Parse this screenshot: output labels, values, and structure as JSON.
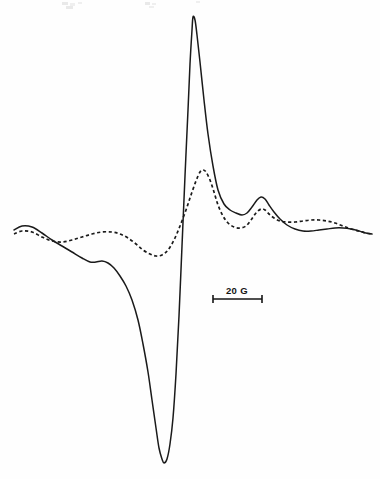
{
  "figure": {
    "title": "",
    "background_color": "#fefefe",
    "width": 380,
    "height": 479
  },
  "scalebar": {
    "label": "20 G",
    "value": 20,
    "unit": "G",
    "unit_name": "gauss",
    "x_start": 213,
    "x_end": 262,
    "y": 299,
    "tick_half_height": 4,
    "label_x": 237,
    "label_y": 294,
    "color": "#151515"
  },
  "chart_data": {
    "type": "line",
    "title": "",
    "subtitle": "",
    "xlabel": "",
    "ylabel": "",
    "grid": false,
    "legend_position": "none",
    "axes_visible": false,
    "x_units": "gauss (relative magnetic field)",
    "y_units": "first derivative of absorption (arbitrary units)",
    "xlim": [
      14,
      372
    ],
    "ylim": [
      479,
      12
    ],
    "series": [
      {
        "name": "solid-trace",
        "style": "solid",
        "color": "#1a1a1a",
        "stroke_width": 1.5,
        "peak_max": {
          "x": 193,
          "y": 17
        },
        "peak_min": {
          "x": 163,
          "y": 463
        },
        "points": [
          [
            14,
            230
          ],
          [
            22,
            226
          ],
          [
            32,
            227
          ],
          [
            42,
            233
          ],
          [
            52,
            240
          ],
          [
            62,
            246
          ],
          [
            72,
            252
          ],
          [
            82,
            258
          ],
          [
            90,
            262
          ],
          [
            96,
            262
          ],
          [
            102,
            261
          ],
          [
            108,
            263
          ],
          [
            114,
            268
          ],
          [
            120,
            276
          ],
          [
            126,
            286
          ],
          [
            132,
            300
          ],
          [
            138,
            320
          ],
          [
            143,
            344
          ],
          [
            148,
            372
          ],
          [
            152,
            400
          ],
          [
            156,
            428
          ],
          [
            159,
            448
          ],
          [
            162,
            459
          ],
          [
            164,
            463
          ],
          [
            167,
            459
          ],
          [
            170,
            444
          ],
          [
            173,
            418
          ],
          [
            176,
            374
          ],
          [
            179,
            316
          ],
          [
            182,
            246
          ],
          [
            185,
            176
          ],
          [
            188,
            110
          ],
          [
            190,
            64
          ],
          [
            192,
            30
          ],
          [
            193,
            17
          ],
          [
            195,
            20
          ],
          [
            197,
            35
          ],
          [
            200,
            62
          ],
          [
            204,
            100
          ],
          [
            208,
            134
          ],
          [
            213,
            166
          ],
          [
            218,
            190
          ],
          [
            224,
            204
          ],
          [
            230,
            210
          ],
          [
            236,
            213
          ],
          [
            242,
            215
          ],
          [
            247,
            213
          ],
          [
            252,
            207
          ],
          [
            257,
            200
          ],
          [
            261,
            197
          ],
          [
            265,
            199
          ],
          [
            269,
            205
          ],
          [
            274,
            212
          ],
          [
            280,
            219
          ],
          [
            287,
            225
          ],
          [
            295,
            229
          ],
          [
            303,
            231
          ],
          [
            311,
            231
          ],
          [
            319,
            230
          ],
          [
            327,
            229
          ],
          [
            335,
            228
          ],
          [
            343,
            228
          ],
          [
            351,
            229
          ],
          [
            359,
            231
          ],
          [
            366,
            233
          ],
          [
            372,
            234
          ]
        ]
      },
      {
        "name": "dashed-trace",
        "style": "dashed",
        "color": "#1a1a1a",
        "stroke_width": 1.7,
        "dash_pattern": "3.2 2.6",
        "peak_max": {
          "x": 202,
          "y": 170
        },
        "points": [
          [
            14,
            234
          ],
          [
            22,
            231
          ],
          [
            32,
            232
          ],
          [
            42,
            237
          ],
          [
            52,
            241
          ],
          [
            62,
            242
          ],
          [
            72,
            240
          ],
          [
            82,
            237
          ],
          [
            92,
            234
          ],
          [
            102,
            232
          ],
          [
            112,
            232
          ],
          [
            120,
            234
          ],
          [
            128,
            238
          ],
          [
            136,
            244
          ],
          [
            143,
            250
          ],
          [
            150,
            254
          ],
          [
            156,
            256
          ],
          [
            162,
            255
          ],
          [
            168,
            250
          ],
          [
            174,
            240
          ],
          [
            180,
            226
          ],
          [
            186,
            210
          ],
          [
            191,
            195
          ],
          [
            196,
            181
          ],
          [
            200,
            172
          ],
          [
            203,
            170
          ],
          [
            206,
            172
          ],
          [
            210,
            180
          ],
          [
            214,
            192
          ],
          [
            218,
            205
          ],
          [
            223,
            216
          ],
          [
            228,
            223
          ],
          [
            234,
            227
          ],
          [
            240,
            228
          ],
          [
            246,
            226
          ],
          [
            251,
            220
          ],
          [
            256,
            213
          ],
          [
            261,
            209
          ],
          [
            265,
            210
          ],
          [
            269,
            214
          ],
          [
            274,
            218
          ],
          [
            280,
            221
          ],
          [
            287,
            222
          ],
          [
            295,
            222
          ],
          [
            303,
            221
          ],
          [
            311,
            220
          ],
          [
            319,
            220
          ],
          [
            327,
            221
          ],
          [
            335,
            223
          ],
          [
            343,
            226
          ],
          [
            351,
            229
          ],
          [
            359,
            231
          ],
          [
            366,
            233
          ],
          [
            372,
            234
          ]
        ]
      }
    ]
  },
  "artifacts": {
    "note": "faint scan speckles along top edge",
    "marks": [
      {
        "x": 62,
        "y": 2,
        "w": 6,
        "h": 3
      },
      {
        "x": 70,
        "y": 3,
        "w": 5,
        "h": 3
      },
      {
        "x": 78,
        "y": 2,
        "w": 4,
        "h": 2
      },
      {
        "x": 66,
        "y": 6,
        "w": 7,
        "h": 3
      },
      {
        "x": 145,
        "y": 2,
        "w": 5,
        "h": 3
      },
      {
        "x": 152,
        "y": 3,
        "w": 4,
        "h": 2
      },
      {
        "x": 149,
        "y": 6,
        "w": 5,
        "h": 2
      },
      {
        "x": 196,
        "y": 1,
        "w": 4,
        "h": 2
      }
    ]
  }
}
